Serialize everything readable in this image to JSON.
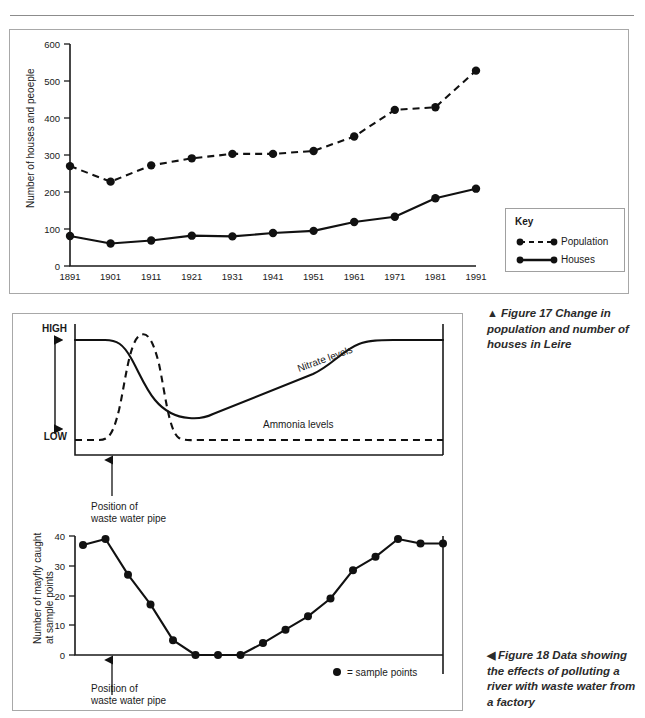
{
  "figure17": {
    "caption_marker": "▲",
    "caption_text": "Figure 17 Change in population and number of houses in Leire",
    "key": {
      "title": "Key",
      "items": [
        {
          "label": "Population",
          "style": "dashed"
        },
        {
          "label": "Houses",
          "style": "solid"
        }
      ]
    }
  },
  "figure18": {
    "caption_marker": "◀",
    "caption_text": "Figure 18 Data showing the effects of polluting a river with waste water from a factory",
    "annotation_top": "Position of\nwaste water pipe",
    "annotation_top_line1": "Position of",
    "annotation_top_line2": "waste water pipe",
    "annotation_bottom_line1": "Position of",
    "annotation_bottom_line2": "waste water pipe",
    "sample_points_legend": "= sample points"
  },
  "chart_data": [
    {
      "id": "population-houses",
      "type": "line",
      "title": "Change in population and number of houses in Leire",
      "xlabel": "",
      "ylabel": "Number of houses and peoeple",
      "categories": [
        "1891",
        "1901",
        "1911",
        "1921",
        "1931",
        "1941",
        "1951",
        "1961",
        "1971",
        "1981",
        "1991"
      ],
      "yticks": [
        0,
        100,
        200,
        300,
        400,
        500,
        600
      ],
      "ylim": [
        0,
        600
      ],
      "grid": false,
      "legend_position": "right",
      "series": [
        {
          "name": "Population",
          "style": "dashed",
          "markers": true,
          "values": [
            270,
            228,
            272,
            291,
            303,
            303,
            311,
            350,
            422,
            429,
            528
          ]
        },
        {
          "name": "Houses",
          "style": "solid",
          "markers": true,
          "values": [
            81,
            61,
            69,
            82,
            80,
            89,
            95,
            119,
            133,
            183,
            209
          ]
        }
      ]
    },
    {
      "id": "nitrate-ammonia",
      "type": "line",
      "title": "",
      "xlabel": "",
      "ylabel": "",
      "ytick_labels": [
        "HIGH",
        "LOW"
      ],
      "grid": false,
      "annotations": [
        "Nitrate levels",
        "Ammonia levels",
        "Position of waste water pipe"
      ],
      "series": [
        {
          "name": "Nitrate levels",
          "style": "solid",
          "markers": false
        },
        {
          "name": "Ammonia levels",
          "style": "dashed",
          "markers": false
        }
      ]
    },
    {
      "id": "mayfly-counts",
      "type": "line",
      "title": "",
      "xlabel": "",
      "ylabel": "Number of mayfly caught at sample points",
      "ylabel_line1": "Number of mayfly caught",
      "ylabel_line2": "at sample points",
      "yticks": [
        0,
        10,
        20,
        30,
        40
      ],
      "ylim": [
        0,
        42
      ],
      "grid": false,
      "values": [
        37,
        39,
        27,
        17,
        5,
        0,
        0,
        0,
        4,
        8.5,
        13,
        19,
        28.5,
        33,
        39,
        37.5,
        37.5
      ],
      "series": [
        {
          "name": "Mayfly caught at sample points",
          "style": "solid",
          "markers": true,
          "values": [
            37,
            39,
            27,
            17,
            5,
            0,
            0,
            0,
            4,
            8.5,
            13,
            19,
            28.5,
            33,
            39,
            37.5,
            37.5
          ]
        }
      ]
    }
  ]
}
